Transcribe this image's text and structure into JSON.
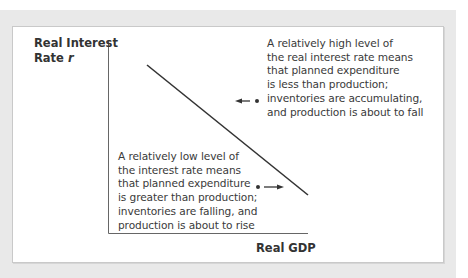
{
  "diagram": {
    "y_axis_label": "Real Interest Rate",
    "y_axis_label_line1": "Real Interest",
    "y_axis_label_line2_text": "Rate ",
    "y_axis_symbol": "r",
    "x_axis_label": "Real GDP",
    "curve": {
      "description": "Downward-sloping IS curve",
      "start": [
        147,
        65
      ],
      "end": [
        308,
        195
      ]
    },
    "annotations": [
      {
        "id": "high-rate",
        "lines": [
          "A relatively high level of",
          "the real interest rate means",
          "that planned expenditure",
          "is less than production;",
          "inventories are accumulating,",
          "and production is about to fall"
        ],
        "arrow_direction": "left",
        "point_side": "right-of-curve"
      },
      {
        "id": "low-rate",
        "lines": [
          "A relatively low level of",
          "the interest rate means",
          "that planned expenditure",
          "is greater than production;",
          "inventories are falling, and",
          "production is about to rise"
        ],
        "arrow_direction": "right",
        "point_side": "left-of-curve"
      }
    ],
    "colors": {
      "frame": "#e9e9e9",
      "panel": "#ffffff",
      "axis": "#555555",
      "curve": "#333333",
      "text": "#3a3a3a"
    }
  }
}
